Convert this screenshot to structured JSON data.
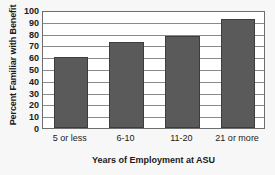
{
  "chart_data": {
    "type": "bar",
    "title": "",
    "categories": [
      "5 or less",
      "6-10",
      "11-20",
      "21 or more"
    ],
    "values": [
      60,
      73,
      78,
      92
    ],
    "xlabel": "Years of Employment at ASU",
    "ylabel": "Percent Familiar with Benefit",
    "ylim": [
      0,
      100
    ],
    "yticks": [
      0,
      10,
      20,
      30,
      40,
      50,
      60,
      70,
      80,
      90,
      100
    ],
    "ytick_labels": [
      "0",
      "10",
      "20",
      "30",
      "40",
      "50",
      "60",
      "70",
      "80",
      "90",
      "100"
    ],
    "grid": true,
    "grid_axis": "y",
    "legend": false,
    "bar_color": "#5a5a5a",
    "bar_edge_color": "#3d3d3d",
    "gridline_color": "#8a8a8a",
    "plot_border_color": "#6d6d6d",
    "plot_background": "#ffffff",
    "figure_background": "#f7f7f7"
  }
}
